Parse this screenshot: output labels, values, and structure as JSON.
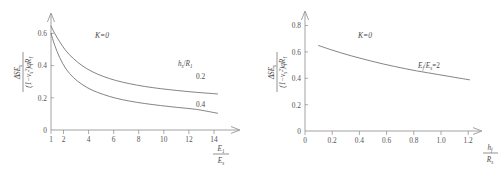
{
  "figure": {
    "background": "#ffffff",
    "axis_color": "#8a8a8a",
    "curve_color": "#6e6e6e",
    "text_color": "#4a4a4a"
  },
  "chart_data": [
    {
      "type": "line",
      "panel": "left",
      "title": "",
      "xlabel": "E_1/E_s",
      "ylabel": "ΔSE_s/(1-ν_s²)qR_1",
      "xlim": [
        1,
        14.6
      ],
      "ylim": [
        0,
        0.7
      ],
      "xticks": [
        1,
        2,
        4,
        6,
        8,
        10,
        12,
        14
      ],
      "xtick_labels": [
        "1",
        "2",
        "4",
        "6",
        "8",
        "10",
        "12",
        "14"
      ],
      "yticks": [
        0,
        0.2,
        0.4,
        0.6
      ],
      "ytick_labels": [
        "0",
        "0.2",
        "0.4",
        "0.6"
      ],
      "grid": false,
      "legend": "inline-curve-labels",
      "annotations": [
        {
          "text": "K=0",
          "x": 4.6,
          "y": 0.575
        },
        {
          "text": "h_s/R_1",
          "x": 11.6,
          "y": 0.395
        }
      ],
      "series": [
        {
          "name": "0.2",
          "label": "0.2",
          "x": [
            1,
            1.3,
            1.7,
            2.2,
            2.8,
            3.5,
            4.3,
            5.2,
            6.2,
            7.3,
            8.5,
            9.8,
            11.2,
            12.7,
            14.4
          ],
          "values": [
            0.645,
            0.6,
            0.548,
            0.492,
            0.444,
            0.4,
            0.363,
            0.333,
            0.308,
            0.288,
            0.271,
            0.257,
            0.245,
            0.234,
            0.224
          ]
        },
        {
          "name": "0.4",
          "label": "0.4",
          "x": [
            1,
            1.3,
            1.7,
            2.2,
            2.8,
            3.5,
            4.3,
            5.2,
            6.2,
            7.3,
            8.5,
            9.8,
            11.2,
            12.7,
            14.4
          ],
          "values": [
            0.6,
            0.526,
            0.45,
            0.38,
            0.326,
            0.283,
            0.248,
            0.221,
            0.198,
            0.18,
            0.165,
            0.152,
            0.14,
            0.128,
            0.104
          ]
        }
      ]
    },
    {
      "type": "line",
      "panel": "right",
      "title": "",
      "xlabel": "h_f/R_s",
      "ylabel": "ΔSE_s/(1-ν_s²)qR_1",
      "xlim": [
        0,
        1.3
      ],
      "ylim": [
        0,
        0.88
      ],
      "xticks": [
        0,
        0.2,
        0.4,
        0.6,
        0.8,
        1.0,
        1.2
      ],
      "xtick_labels": [
        "0",
        "0.2",
        "0.4",
        "0.6",
        "0.8",
        "1.0",
        "1.2"
      ],
      "yticks": [
        0,
        0.2,
        0.4,
        0.6,
        0.8
      ],
      "ytick_labels": [
        "0",
        "0.2",
        "0.4",
        "0.6",
        "0.8"
      ],
      "grid": false,
      "legend": "inline-curve-labels",
      "annotations": [
        {
          "text": "K=0",
          "x": 0.5,
          "y": 0.7
        },
        {
          "text": "E_f/E_s=2",
          "x": 0.93,
          "y": 0.493
        }
      ],
      "series": [
        {
          "name": "E_f/E_s=2",
          "label": "E_f/E_s=2",
          "x": [
            0.1,
            0.18,
            0.26,
            0.34,
            0.42,
            0.5,
            0.58,
            0.66,
            0.74,
            0.82,
            0.9,
            0.98,
            1.06,
            1.14,
            1.21
          ],
          "values": [
            0.648,
            0.62,
            0.594,
            0.57,
            0.548,
            0.527,
            0.507,
            0.489,
            0.472,
            0.456,
            0.442,
            0.428,
            0.414,
            0.4,
            0.388
          ]
        }
      ]
    }
  ],
  "left_chart": {
    "k_annotation": "K=0",
    "curve_family_label_num": "h",
    "curve_family_label_num_sub": "s",
    "curve_family_label_den": "R",
    "curve_family_label_den_sub": "1",
    "curve_labels": [
      "0.2",
      "0.4"
    ],
    "x_ticks": [
      "1",
      "2",
      "4",
      "6",
      "8",
      "10",
      "12",
      "14"
    ],
    "y_ticks": [
      "0.6",
      "0.4",
      "0.2",
      "0"
    ],
    "x_axis_num": "E",
    "x_axis_num_sub": "1",
    "x_axis_den": "E",
    "x_axis_den_sub": "s",
    "y_axis_num_delta": "ΔSE",
    "y_axis_num_sub": "s",
    "y_axis_den_open": "(1−ν",
    "y_axis_den_sub": "s",
    "y_axis_den_sup": "2",
    "y_axis_den_close": ")qR",
    "y_axis_den_close_sub": "1"
  },
  "right_chart": {
    "k_annotation": "K=0",
    "curve_label_num": "E",
    "curve_label_num_sub": "f",
    "curve_label_den": "E",
    "curve_label_den_sub": "s",
    "curve_label_eq": "=2",
    "x_ticks": [
      "0",
      "0.2",
      "0.4",
      "0.6",
      "0.8",
      "1.0",
      "1.2"
    ],
    "y_ticks": [
      "0.8",
      "0.6",
      "0.4",
      "0.2",
      "0"
    ],
    "x_axis_num": "h",
    "x_axis_num_sub": "f",
    "x_axis_den": "R",
    "x_axis_den_sub": "s",
    "y_axis_num_delta": "ΔSE",
    "y_axis_num_sub": "s",
    "y_axis_den_open": "(1−ν",
    "y_axis_den_sub": "s",
    "y_axis_den_sup": "2",
    "y_axis_den_close": ")qR",
    "y_axis_den_close_sub": "1"
  }
}
